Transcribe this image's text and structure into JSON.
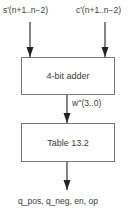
{
  "diagram": {
    "inputs": [
      {
        "label": "s'(n+1..n−2)"
      },
      {
        "label": "c'(n+1..n−2)"
      }
    ],
    "blocks": [
      {
        "label": "4-bit adder"
      },
      {
        "label": "Table 13.2"
      }
    ],
    "intermediate_signal": {
      "label": "w''(3..0)"
    },
    "outputs": {
      "label": "q_pos, q_neg, en, op"
    }
  }
}
